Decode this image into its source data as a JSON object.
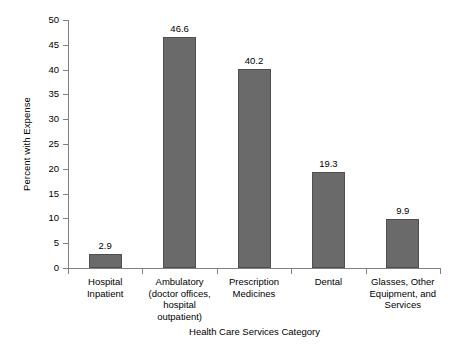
{
  "chart_data": {
    "type": "bar",
    "title": "",
    "xlabel": "Health Care Services Category",
    "ylabel": "Percent with Expense",
    "categories": [
      "Hospital\nInpatient",
      "Ambulatory\n(doctor offices,\nhospital\noutpatient)",
      "Prescription\nMedicines",
      "Dental",
      "Glasses, Other\nEquipment, and\nServices"
    ],
    "values": [
      2.9,
      46.6,
      40.2,
      19.3,
      9.9
    ],
    "data_labels": [
      "2.9",
      "46.6",
      "40.2",
      "19.3",
      "9.9"
    ],
    "ylim": [
      0,
      50
    ],
    "ytick_step": 5,
    "ytick_labels": [
      "0",
      "5",
      "10",
      "15",
      "20",
      "25",
      "30",
      "35",
      "40",
      "45",
      "50"
    ],
    "grid": false,
    "legend": null,
    "bar_color": "#6a6a6a",
    "bar_border_color": "#4f4f4f",
    "axis_color": "#808080",
    "background_color": "#ffffff"
  }
}
